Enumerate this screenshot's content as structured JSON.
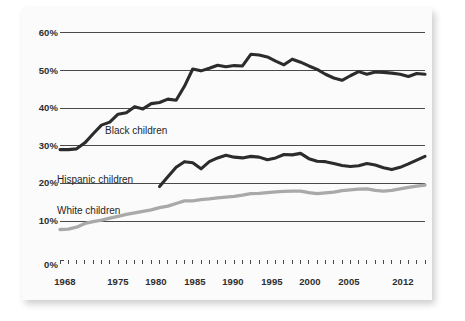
{
  "chart_data": {
    "type": "line",
    "title": "",
    "subtitle": "",
    "xlabel": "",
    "ylabel": "",
    "xlim": [
      1968,
      2012
    ],
    "ylim": [
      0,
      60
    ],
    "grid": true,
    "legend_position": "inline-annotations",
    "y_ticks": [
      "0%",
      "10%",
      "20%",
      "30%",
      "40%",
      "50%",
      "60%"
    ],
    "y_tick_values": [
      0,
      10,
      20,
      30,
      40,
      50,
      60
    ],
    "x_ticks": [
      "1968",
      "1975",
      "1980",
      "1985",
      "1990",
      "1995",
      "2000",
      "2005",
      "2012"
    ],
    "x_tick_values": [
      1968,
      1975,
      1980,
      1985,
      1990,
      1995,
      2000,
      2005,
      2012
    ],
    "x_minor_tick_interval": 1,
    "colors": {
      "black_children": "#2c2c2c",
      "hispanic_children": "#2c2c2c",
      "white_children": "#a9a9a9",
      "gridline": "#4a4a4a",
      "panel_background": "#fbfbfb",
      "text": "#1f1f1f"
    },
    "series": [
      {
        "name": "Black children",
        "color": "#2c2c2c",
        "label_text": "Black children",
        "x": [
          1968,
          1969,
          1970,
          1971,
          1972,
          1973,
          1974,
          1975,
          1976,
          1977,
          1978,
          1979,
          1980,
          1981,
          1982,
          1983,
          1984,
          1985,
          1986,
          1987,
          1988,
          1989,
          1990,
          1991,
          1992,
          1993,
          1994,
          1995,
          1996,
          1997,
          1998,
          1999,
          2000,
          2001,
          2002,
          2003,
          2004,
          2005,
          2006,
          2007,
          2008,
          2009,
          2010,
          2011,
          2012
        ],
        "values": [
          29.0,
          29.0,
          29.2,
          30.8,
          33.2,
          35.5,
          36.3,
          38.4,
          38.8,
          40.4,
          39.8,
          41.2,
          41.5,
          42.4,
          42.1,
          45.8,
          50.4,
          49.9,
          50.6,
          51.4,
          51.0,
          51.3,
          51.2,
          54.3,
          54.1,
          53.6,
          52.5,
          51.5,
          53.0,
          52.2,
          51.2,
          50.3,
          49.0,
          48.0,
          47.4,
          48.6,
          49.7,
          49.0,
          49.6,
          49.5,
          49.3,
          49.0,
          48.4,
          49.2,
          49.0
        ]
      },
      {
        "name": "Hispanic children",
        "color": "#2c2c2c",
        "label_text": "Hispanic children",
        "x": [
          1980,
          1981,
          1982,
          1983,
          1984,
          1985,
          1986,
          1987,
          1988,
          1989,
          1990,
          1991,
          1992,
          1993,
          1994,
          1995,
          1996,
          1997,
          1998,
          1999,
          2000,
          2001,
          2002,
          2003,
          2004,
          2005,
          2006,
          2007,
          2008,
          2009,
          2010,
          2011,
          2012
        ],
        "values": [
          19.2,
          21.8,
          24.3,
          25.8,
          25.5,
          23.9,
          25.8,
          26.8,
          27.5,
          27.0,
          26.8,
          27.2,
          27.0,
          26.3,
          26.8,
          27.7,
          27.6,
          28.0,
          26.6,
          25.9,
          25.8,
          25.3,
          24.8,
          24.5,
          24.7,
          25.3,
          24.9,
          24.2,
          23.7,
          24.3,
          25.2,
          26.2,
          27.2
        ]
      },
      {
        "name": "White children",
        "color": "#a9a9a9",
        "label_text": "White children",
        "x": [
          1968,
          1969,
          1970,
          1971,
          1972,
          1973,
          1974,
          1975,
          1976,
          1977,
          1978,
          1979,
          1980,
          1981,
          1982,
          1983,
          1984,
          1985,
          1986,
          1987,
          1988,
          1989,
          1990,
          1991,
          1992,
          1993,
          1994,
          1995,
          1996,
          1997,
          1998,
          1999,
          2000,
          2001,
          2002,
          2003,
          2004,
          2005,
          2006,
          2007,
          2008,
          2009,
          2010,
          2011,
          2012
        ],
        "values": [
          7.8,
          7.9,
          8.4,
          9.4,
          9.9,
          10.3,
          10.8,
          11.3,
          11.8,
          12.2,
          12.6,
          13.0,
          13.6,
          14.0,
          14.7,
          15.4,
          15.4,
          15.7,
          15.9,
          16.2,
          16.4,
          16.6,
          16.9,
          17.3,
          17.4,
          17.6,
          17.8,
          17.9,
          18.0,
          18.0,
          17.6,
          17.3,
          17.5,
          17.7,
          18.1,
          18.3,
          18.5,
          18.6,
          18.2,
          18.0,
          18.2,
          18.6,
          19.0,
          19.3,
          19.6
        ]
      }
    ]
  },
  "labels": {
    "black_children": "Black children",
    "hispanic_children": "Hispanic children",
    "white_children": "White children"
  },
  "axis": {
    "y": [
      "60%",
      "50%",
      "40%",
      "30%",
      "20%",
      "10%",
      "0%"
    ],
    "x": [
      "1968",
      "1975",
      "1980",
      "1985",
      "1990",
      "1995",
      "2000",
      "2005",
      "2012"
    ]
  }
}
